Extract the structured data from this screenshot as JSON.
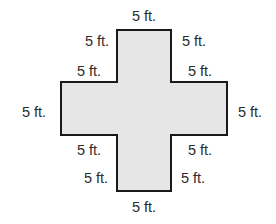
{
  "diagram": {
    "type": "plus-shaped polygon with side-length labels",
    "fill_color": "#e6e6e6",
    "stroke_color": "#1a1a1a",
    "text_color": "#2b2b2b",
    "shape_points": "117,30 171,30 171,82 227,82 227,135 171,135 171,191 117,191 117,135 61,135 61,82 117,82",
    "labels": [
      {
        "id": "top",
        "text": "5 ft.",
        "x": 144,
        "y": 16
      },
      {
        "id": "upper-left-stem",
        "text": "5 ft.",
        "x": 97,
        "y": 41
      },
      {
        "id": "upper-right-stem",
        "text": "5 ft.",
        "x": 194,
        "y": 41
      },
      {
        "id": "left-arm-top",
        "text": "5 ft.",
        "x": 89,
        "y": 71
      },
      {
        "id": "right-arm-top",
        "text": "5 ft.",
        "x": 200,
        "y": 71
      },
      {
        "id": "left-end",
        "text": "5 ft.",
        "x": 34,
        "y": 112
      },
      {
        "id": "right-end",
        "text": "5 ft.",
        "x": 250,
        "y": 112
      },
      {
        "id": "left-arm-bottom",
        "text": "5 ft.",
        "x": 89,
        "y": 150
      },
      {
        "id": "right-arm-bottom",
        "text": "5 ft.",
        "x": 200,
        "y": 150
      },
      {
        "id": "lower-left-stem",
        "text": "5 ft.",
        "x": 96,
        "y": 178
      },
      {
        "id": "lower-right-stem",
        "text": "5 ft.",
        "x": 193,
        "y": 178
      },
      {
        "id": "bottom",
        "text": "5 ft.",
        "x": 144,
        "y": 207
      }
    ]
  }
}
